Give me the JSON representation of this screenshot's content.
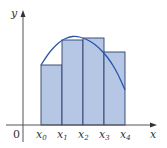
{
  "figure": {
    "axis_labels": {
      "x": "x",
      "y": "y",
      "origin": "0"
    },
    "tick_labels": [
      {
        "base": "x",
        "sub": "0"
      },
      {
        "base": "x",
        "sub": "1"
      },
      {
        "base": "x",
        "sub": "2"
      },
      {
        "base": "x",
        "sub": "3"
      },
      {
        "base": "x",
        "sub": "4"
      }
    ],
    "colors": {
      "bar_fill": "#b6c7e6",
      "bar_stroke": "#2b3f6b",
      "curve": "#2a55a8",
      "axis": "#555555"
    }
  },
  "geometry": {
    "origin": [
      23,
      125
    ],
    "x_ticks": [
      41,
      62,
      83,
      104,
      125
    ],
    "bar_tops": [
      65,
      40,
      38,
      52
    ],
    "curve_points": [
      [
        41,
        65
      ],
      [
        48,
        54
      ],
      [
        55,
        46
      ],
      [
        62,
        40
      ],
      [
        69,
        37
      ],
      [
        76,
        36
      ],
      [
        83,
        38
      ],
      [
        90,
        41
      ],
      [
        97,
        46
      ],
      [
        104,
        53
      ],
      [
        111,
        62
      ],
      [
        118,
        74
      ],
      [
        125,
        90
      ]
    ]
  }
}
